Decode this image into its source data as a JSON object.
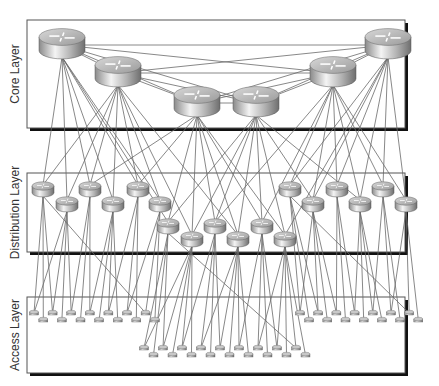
{
  "diagram": {
    "type": "hierarchical-network",
    "layers": [
      {
        "id": "core",
        "label": "Core Layer",
        "frame": {
          "x": 27,
          "y": 20,
          "w": 378,
          "h": 108
        }
      },
      {
        "id": "distribution",
        "label": "Distribution Layer",
        "frame": {
          "x": 27,
          "y": 173,
          "w": 378,
          "h": 79
        }
      },
      {
        "id": "access",
        "label": "Access Layer",
        "frame": {
          "x": 27,
          "y": 297,
          "w": 378,
          "h": 76
        }
      }
    ],
    "colors": {
      "frame_border": "#555555",
      "frame_shadow": "#111111",
      "link": "#6a6a6a",
      "label": "#333333",
      "device_light": "#f0f0f0",
      "device_dark": "#7a7a7a"
    },
    "core_routers": [
      {
        "x": 62,
        "y": 45
      },
      {
        "x": 118,
        "y": 73
      },
      {
        "x": 197,
        "y": 103
      },
      {
        "x": 256,
        "y": 103
      },
      {
        "x": 333,
        "y": 73
      },
      {
        "x": 388,
        "y": 45
      }
    ],
    "distribution_routers": [
      {
        "x": 43,
        "y": 190
      },
      {
        "x": 67,
        "y": 205
      },
      {
        "x": 90,
        "y": 190
      },
      {
        "x": 113,
        "y": 205
      },
      {
        "x": 138,
        "y": 190
      },
      {
        "x": 160,
        "y": 205
      },
      {
        "x": 168,
        "y": 227
      },
      {
        "x": 192,
        "y": 240
      },
      {
        "x": 215,
        "y": 227
      },
      {
        "x": 238,
        "y": 240
      },
      {
        "x": 262,
        "y": 227
      },
      {
        "x": 285,
        "y": 240
      },
      {
        "x": 290,
        "y": 190
      },
      {
        "x": 313,
        "y": 205
      },
      {
        "x": 337,
        "y": 190
      },
      {
        "x": 360,
        "y": 205
      },
      {
        "x": 383,
        "y": 190
      },
      {
        "x": 406,
        "y": 205
      }
    ],
    "access_switch_count": 60
  }
}
